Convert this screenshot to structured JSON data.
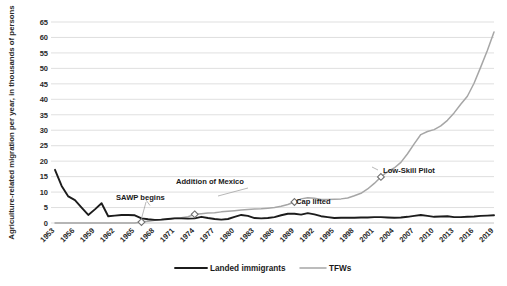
{
  "chart_data": {
    "type": "line",
    "title": "",
    "xlabel": "",
    "ylabel": "Agriculture-related migration per year, in thousands of persons",
    "ylim": [
      0,
      65
    ],
    "ytick_labels": [
      "0",
      "5",
      "10",
      "15",
      "20",
      "25",
      "30",
      "35",
      "40",
      "45",
      "50",
      "55",
      "60",
      "65"
    ],
    "xlim": [
      1953,
      2019
    ],
    "xtick_labels": [
      "1953",
      "1956",
      "1959",
      "1962",
      "1965",
      "1968",
      "1971",
      "1974",
      "1977",
      "1980",
      "1983",
      "1986",
      "1989",
      "1992",
      "1995",
      "1998",
      "2001",
      "2004",
      "2007",
      "2010",
      "2013",
      "2016",
      "2019"
    ],
    "grid": true,
    "legend_position": "bottom",
    "x": [
      1953,
      1954,
      1955,
      1956,
      1957,
      1958,
      1959,
      1960,
      1961,
      1962,
      1963,
      1964,
      1965,
      1966,
      1967,
      1968,
      1969,
      1970,
      1971,
      1972,
      1973,
      1974,
      1975,
      1976,
      1977,
      1978,
      1979,
      1980,
      1981,
      1982,
      1983,
      1984,
      1985,
      1986,
      1987,
      1988,
      1989,
      1990,
      1991,
      1992,
      1993,
      1994,
      1995,
      1996,
      1997,
      1998,
      1999,
      2000,
      2001,
      2002,
      2003,
      2004,
      2005,
      2006,
      2007,
      2008,
      2009,
      2010,
      2011,
      2012,
      2013,
      2014,
      2015,
      2016,
      2017,
      2018,
      2019
    ],
    "series": [
      {
        "name": "Landed immigrants",
        "color": "#1c1c1c",
        "values": [
          17.2,
          12.0,
          8.6,
          7.4,
          5.0,
          2.6,
          4.4,
          6.4,
          2.2,
          2.4,
          2.6,
          2.6,
          2.5,
          1.5,
          1.2,
          1.0,
          1.1,
          1.3,
          1.5,
          1.5,
          1.4,
          1.5,
          2.0,
          1.6,
          1.3,
          1.1,
          1.3,
          2.0,
          2.6,
          2.3,
          1.6,
          1.5,
          1.6,
          1.9,
          2.5,
          3.0,
          3.0,
          2.7,
          3.2,
          2.8,
          2.2,
          1.9,
          1.6,
          1.7,
          1.7,
          1.7,
          1.8,
          1.8,
          1.9,
          1.9,
          1.8,
          1.7,
          1.8,
          2.0,
          2.3,
          2.6,
          2.3,
          2.0,
          2.1,
          2.2,
          1.9,
          1.9,
          2.0,
          2.1,
          2.3,
          2.4,
          2.5
        ]
      },
      {
        "name": "TFWs",
        "color": "#a6a6a6",
        "values": [
          0,
          0,
          0,
          0,
          0,
          0,
          0,
          0,
          0,
          0,
          0,
          0,
          0,
          0.3,
          0.6,
          0.9,
          1.1,
          1.3,
          1.5,
          1.7,
          2.0,
          2.8,
          3.0,
          3.2,
          3.3,
          3.6,
          3.8,
          4.0,
          4.2,
          4.4,
          4.5,
          4.6,
          4.8,
          5.0,
          5.4,
          6.0,
          6.8,
          7.8,
          8.2,
          8.0,
          7.6,
          7.6,
          7.7,
          7.8,
          8.1,
          8.8,
          9.6,
          11.0,
          12.8,
          14.9,
          16.6,
          17.8,
          19.6,
          22.4,
          25.6,
          28.6,
          29.6,
          30.2,
          31.4,
          33.2,
          35.6,
          38.4,
          41.0,
          45.2,
          50.4,
          55.8,
          61.8
        ]
      }
    ],
    "annotations": [
      {
        "label": "SAWP begins",
        "x": 1966,
        "y": 0.3
      },
      {
        "label": "Addition of Mexico",
        "x": 1974,
        "y": 2.8
      },
      {
        "label": "Cap lifted",
        "x": 1989,
        "y": 6.8
      },
      {
        "label": "Low-Skill Pilot",
        "x": 2002,
        "y": 14.9
      }
    ]
  },
  "legend": {
    "items": [
      {
        "label": "Landed immigrants"
      },
      {
        "label": "TFWs"
      }
    ]
  }
}
